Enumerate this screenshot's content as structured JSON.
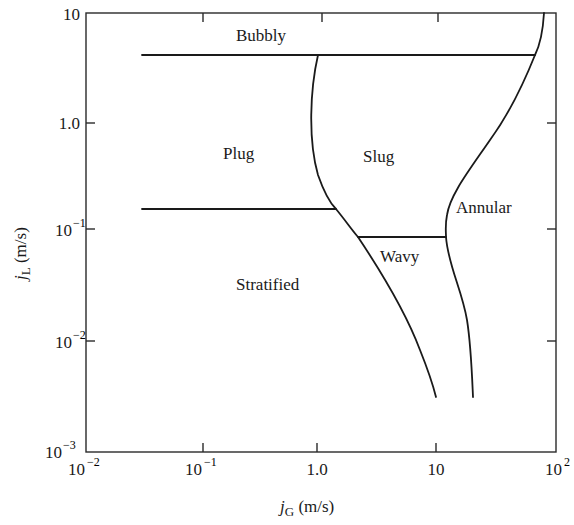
{
  "figure": {
    "type": "flow-regime-map",
    "x_axis": {
      "label_main": "j",
      "label_sub": "G",
      "label_unit": " (m/s)",
      "scale": "log",
      "range": [
        0.01,
        100
      ],
      "ticks": [
        {
          "value": 0.01,
          "base": "10",
          "exp": "−2"
        },
        {
          "value": 0.1,
          "base": "10",
          "exp": "−1"
        },
        {
          "value": 1,
          "base": "1.0",
          "exp": ""
        },
        {
          "value": 10,
          "base": "10",
          "exp": ""
        },
        {
          "value": 100,
          "base": "10",
          "exp": "2"
        }
      ]
    },
    "y_axis": {
      "label_main": "j",
      "label_sub": "L",
      "label_unit": " (m/s)",
      "scale": "log",
      "range": [
        0.001,
        10
      ],
      "ticks": [
        {
          "value": 10,
          "base": "10",
          "exp": ""
        },
        {
          "value": 1,
          "base": "1.0",
          "exp": ""
        },
        {
          "value": 0.1,
          "base": "10",
          "exp": "−1"
        },
        {
          "value": 0.01,
          "base": "10",
          "exp": "−2"
        },
        {
          "value": 0.001,
          "base": "10",
          "exp": "−3"
        }
      ]
    },
    "regions": [
      {
        "name": "Bubbly",
        "label": "Bubbly"
      },
      {
        "name": "Plug",
        "label": "Plug"
      },
      {
        "name": "Slug",
        "label": "Slug"
      },
      {
        "name": "Annular",
        "label": "Annular"
      },
      {
        "name": "Wavy",
        "label": "Wavy"
      },
      {
        "name": "Stratified",
        "label": "Stratified"
      }
    ],
    "boundaries": [
      {
        "name": "bubbly-plug-slug",
        "points_jG_jL": [
          [
            0.03,
            4.2
          ],
          [
            65,
            4.2
          ]
        ]
      },
      {
        "name": "plug-stratified",
        "points_jG_jL": [
          [
            0.03,
            0.16
          ],
          [
            1.6,
            0.16
          ]
        ]
      },
      {
        "name": "slug-wavy",
        "points_jG_jL": [
          [
            2.0,
            0.085
          ],
          [
            12,
            0.085
          ]
        ]
      },
      {
        "name": "plug-slug / stratified-wavy",
        "points_jG_jL": [
          [
            1.0,
            4.2
          ],
          [
            0.9,
            1.0
          ],
          [
            1.6,
            0.16
          ],
          [
            2.0,
            0.085
          ],
          [
            4,
            0.02
          ],
          [
            10,
            0.003
          ]
        ]
      },
      {
        "name": "slug-annular / wavy-annular",
        "points_jG_jL": [
          [
            80,
            10
          ],
          [
            65,
            4.2
          ],
          [
            30,
            0.8
          ],
          [
            12,
            0.16
          ],
          [
            12,
            0.085
          ],
          [
            18,
            0.02
          ],
          [
            20,
            0.003
          ]
        ]
      }
    ]
  }
}
